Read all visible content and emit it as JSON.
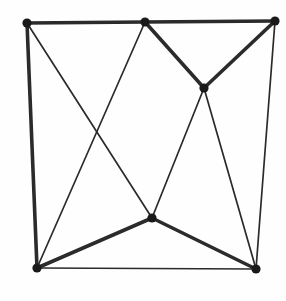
{
  "figure": {
    "kind": "graph-drawing",
    "caption": "",
    "width": 286,
    "height": 301,
    "background_color": "#fefefe",
    "ink_color": "#2b2b2b",
    "vertex_color": "#1a1a1a",
    "thick_stroke_width": 3.6,
    "thin_stroke_width": 1.7,
    "vertex_radius": 4.6,
    "vertex_count": 7,
    "edge_count": 12
  },
  "vertices": [
    {
      "id": "v-top-left",
      "label": "top-left corner",
      "x": 27,
      "y": 23,
      "degree": 3
    },
    {
      "id": "v-top-middle",
      "label": "top-middle",
      "x": 145,
      "y": 22,
      "degree": 4
    },
    {
      "id": "v-top-right",
      "label": "top-right corner",
      "x": 275,
      "y": 21,
      "degree": 3
    },
    {
      "id": "v-inner-right",
      "label": "inner upper-right",
      "x": 204,
      "y": 88,
      "degree": 4
    },
    {
      "id": "v-center-bottom",
      "label": "inner lower-center",
      "x": 152,
      "y": 218,
      "degree": 4
    },
    {
      "id": "v-bottom-left",
      "label": "bottom-left corner",
      "x": 37,
      "y": 268,
      "degree": 4
    },
    {
      "id": "v-bottom-right",
      "label": "bottom-right corner",
      "x": 256,
      "y": 269,
      "degree": 4
    }
  ],
  "edges": [
    {
      "id": "e-tl-tm",
      "from": "v-top-left",
      "to": "v-top-middle",
      "weight": "thick",
      "x1": 27,
      "y1": 23,
      "x2": 145,
      "y2": 22
    },
    {
      "id": "e-tm-tr",
      "from": "v-top-middle",
      "to": "v-top-right",
      "weight": "thick",
      "x1": 145,
      "y1": 22,
      "x2": 275,
      "y2": 21
    },
    {
      "id": "e-tl-bl",
      "from": "v-top-left",
      "to": "v-bottom-left",
      "weight": "thick",
      "x1": 27,
      "y1": 23,
      "x2": 37,
      "y2": 268
    },
    {
      "id": "e-tr-br",
      "from": "v-top-right",
      "to": "v-bottom-right",
      "weight": "thin",
      "x1": 275,
      "y1": 21,
      "x2": 256,
      "y2": 269
    },
    {
      "id": "e-bl-br",
      "from": "v-bottom-left",
      "to": "v-bottom-right",
      "weight": "thin",
      "x1": 37,
      "y1": 268,
      "x2": 256,
      "y2": 269
    },
    {
      "id": "e-tm-ir",
      "from": "v-top-middle",
      "to": "v-inner-right",
      "weight": "thick",
      "x1": 145,
      "y1": 22,
      "x2": 204,
      "y2": 88
    },
    {
      "id": "e-tr-ir",
      "from": "v-top-right",
      "to": "v-inner-right",
      "weight": "thick",
      "x1": 275,
      "y1": 21,
      "x2": 204,
      "y2": 88
    },
    {
      "id": "e-cb-bl",
      "from": "v-center-bottom",
      "to": "v-bottom-left",
      "weight": "thick",
      "x1": 152,
      "y1": 218,
      "x2": 37,
      "y2": 268
    },
    {
      "id": "e-cb-br",
      "from": "v-center-bottom",
      "to": "v-bottom-right",
      "weight": "thick",
      "x1": 152,
      "y1": 218,
      "x2": 256,
      "y2": 269
    },
    {
      "id": "e-tl-cb",
      "from": "v-top-left",
      "to": "v-center-bottom",
      "weight": "thin",
      "x1": 27,
      "y1": 23,
      "x2": 152,
      "y2": 218
    },
    {
      "id": "e-tm-bl",
      "from": "v-top-middle",
      "to": "v-bottom-left",
      "weight": "thin",
      "x1": 145,
      "y1": 22,
      "x2": 37,
      "y2": 268
    },
    {
      "id": "e-ir-cb",
      "from": "v-inner-right",
      "to": "v-center-bottom",
      "weight": "thin",
      "x1": 204,
      "y1": 88,
      "x2": 152,
      "y2": 218
    },
    {
      "id": "e-ir-br",
      "from": "v-inner-right",
      "to": "v-bottom-right",
      "weight": "thin",
      "x1": 204,
      "y1": 88,
      "x2": 256,
      "y2": 269
    }
  ],
  "crossings": [
    {
      "id": "x-left",
      "label": "left crossing",
      "x": 98,
      "y": 136,
      "edges": [
        "e-tl-cb",
        "e-tm-bl"
      ]
    }
  ]
}
